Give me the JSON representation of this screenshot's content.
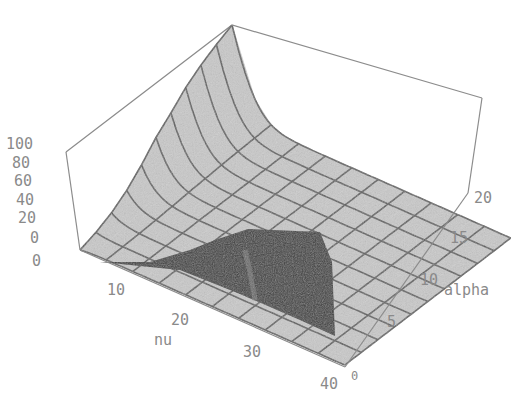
{
  "chart_data": {
    "type": "surface3d",
    "title": "",
    "x_axis": {
      "label": "nu",
      "range": [
        0,
        40
      ],
      "ticks": [
        "10",
        "20",
        "30",
        "40"
      ]
    },
    "y_axis": {
      "label": "alpha",
      "range": [
        0,
        20
      ],
      "ticks": [
        "0",
        "5",
        "10",
        "15",
        "20"
      ]
    },
    "z_axis": {
      "label": "",
      "range": [
        0,
        100
      ],
      "ticks": [
        "0",
        "20",
        "40",
        "60",
        "80",
        "100"
      ]
    },
    "extra_tick_below_z": "0",
    "surface_samples": {
      "nu": [
        0,
        4,
        8,
        12,
        16,
        20,
        24,
        28,
        32,
        36,
        40
      ],
      "alpha": [
        0,
        2,
        4,
        6,
        8,
        10,
        12,
        14,
        16,
        18,
        20
      ],
      "z_at_nu0_by_alpha": [
        0,
        5,
        12,
        22,
        35,
        50,
        62,
        75,
        85,
        93,
        100
      ],
      "z_far_from_nu0": 2
    },
    "colors": {
      "surface": "#c9c9c9",
      "mesh": "#5e5e5e",
      "shadow": "#3e3e3e",
      "box": "#8c8c8c",
      "tick_text": "#8a8a8a"
    }
  }
}
